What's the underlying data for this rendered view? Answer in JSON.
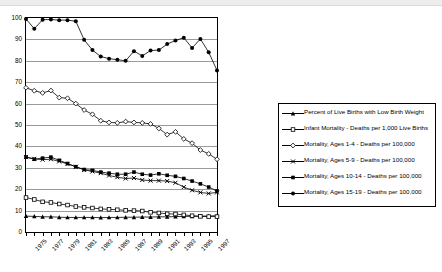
{
  "chart_data": {
    "type": "line",
    "title": "",
    "xlabel": "",
    "ylabel": "",
    "ylim": [
      0,
      100
    ],
    "ytick_values": [
      0,
      10,
      20,
      30,
      40,
      50,
      60,
      70,
      80,
      90,
      100
    ],
    "grid": true,
    "legend_position": "right",
    "x": [
      1975,
      1976,
      1977,
      1978,
      1979,
      1980,
      1981,
      1982,
      1983,
      1984,
      1985,
      1986,
      1987,
      1988,
      1989,
      1990,
      1991,
      1992,
      1993,
      1994,
      1995,
      1996,
      1997,
      1998
    ],
    "xtick_labels": [
      "1975",
      "1977",
      "1979",
      "1981",
      "1983",
      "1985",
      "1987",
      "1989",
      "1991",
      "1993",
      "1995",
      "1997"
    ],
    "xtick_years": [
      1975,
      1977,
      1979,
      1981,
      1983,
      1985,
      1987,
      1989,
      1991,
      1993,
      1995,
      1997
    ],
    "series": [
      {
        "name": "Percent of Live Births with Low Birth Weight",
        "marker": "filled-triangle",
        "color": "#000000",
        "values": [
          7.4,
          7.3,
          7.1,
          7.1,
          6.9,
          6.8,
          6.8,
          6.8,
          6.8,
          6.7,
          6.8,
          6.8,
          6.9,
          6.9,
          7.0,
          7.0,
          7.1,
          7.1,
          7.2,
          7.3,
          7.3,
          7.4,
          7.5,
          7.6
        ]
      },
      {
        "name": "Infant Mortality - Deaths per 1,000 Live Births",
        "marker": "open-square",
        "color": "#000000",
        "values": [
          16.1,
          15.2,
          14.1,
          13.8,
          13.1,
          12.6,
          11.9,
          11.5,
          11.2,
          10.8,
          10.6,
          10.4,
          10.1,
          10.0,
          9.8,
          9.2,
          8.9,
          8.5,
          8.4,
          8.0,
          7.6,
          7.3,
          7.2,
          7.2
        ]
      },
      {
        "name": "Mortality, Ages  1-4 - Deaths per 100,000",
        "marker": "open-diamond",
        "color": "#000000",
        "values": [
          67.4,
          66.0,
          65.0,
          66.1,
          62.8,
          62.5,
          60.0,
          57.0,
          55.0,
          52.0,
          51.2,
          51.0,
          51.6,
          51.2,
          51.0,
          50.5,
          48.4,
          45.5,
          46.8,
          43.5,
          41.5,
          38.3,
          36.5,
          34.0
        ]
      },
      {
        "name": "Mortality, Ages 5-9 - Deaths per 100,000",
        "marker": "x",
        "color": "#000000",
        "values": [
          35.0,
          34.2,
          33.8,
          34.0,
          33.0,
          31.8,
          30.5,
          29.0,
          28.3,
          27.5,
          26.4,
          25.6,
          25.0,
          25.2,
          24.3,
          24.0,
          24.0,
          23.8,
          23.0,
          21.0,
          19.5,
          18.5,
          18.0,
          18.5
        ]
      },
      {
        "name": "Mortality, Ages 10-14 - Deaths per 100,000",
        "marker": "filled-square",
        "color": "#000000",
        "values": [
          35.0,
          34.0,
          34.5,
          35.0,
          33.5,
          32.0,
          30.5,
          29.2,
          28.8,
          28.0,
          27.5,
          27.0,
          27.0,
          28.0,
          27.0,
          26.6,
          27.2,
          26.5,
          26.0,
          25.0,
          23.8,
          22.5,
          21.0,
          19.2
        ]
      },
      {
        "name": "Mortality, Ages 15-19 - Deaths per 100,000",
        "marker": "filled-circle",
        "color": "#000000",
        "values": [
          99.5,
          95.0,
          99.2,
          99.3,
          99.0,
          99.0,
          98.5,
          89.8,
          85.0,
          82.0,
          81.0,
          80.5,
          80.0,
          84.5,
          82.3,
          84.8,
          85.0,
          87.8,
          89.5,
          90.8,
          86.0,
          90.2,
          84.0,
          75.5
        ]
      }
    ]
  }
}
